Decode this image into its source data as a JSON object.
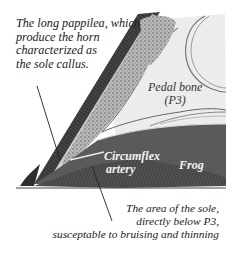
{
  "diagram": {
    "type": "anatomical cross-section",
    "labels": {
      "papillae_note": [
        "The long pappilea, which",
        "produce the horn",
        "characterized as",
        "the sole callus."
      ],
      "pedal_bone": [
        "Pedal bone",
        "(P3)"
      ],
      "circumflex_artery": [
        "Circumflex",
        "artery"
      ],
      "frog": "Frog",
      "sole_note": [
        "The area of the sole,",
        "directly below P3,",
        "susceptable to bruising and thinning"
      ]
    },
    "colors": {
      "background": "#ffffff",
      "hoof_wall_dark": "#3a3a3a",
      "sole_dark": "#4a4a4a",
      "frog_mid": "#5a5a5a",
      "bone_light": "#eeeeee",
      "laminae_stipple": "#9a9a9a",
      "text": "#222222"
    }
  }
}
